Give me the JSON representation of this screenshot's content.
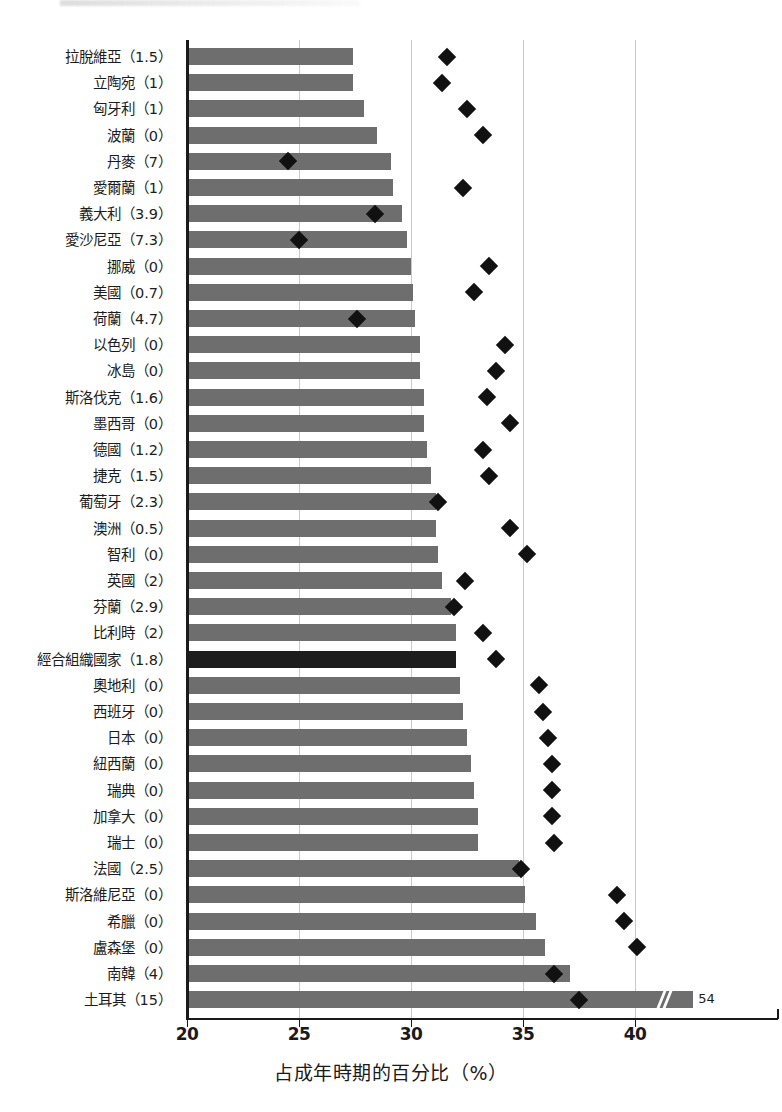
{
  "chart_data": {
    "type": "bar",
    "title": "",
    "xlabel": "占成年時期的百分比（%）",
    "ylabel": "",
    "xlim": [
      20,
      42.6
    ],
    "ticks": [
      20,
      25,
      30,
      35,
      40
    ],
    "tick_labels": [
      "20",
      "25",
      "30",
      "35",
      "40"
    ],
    "grid": "vertical",
    "legend": "none",
    "series": [
      {
        "name": "bar",
        "marker": "bar"
      },
      {
        "name": "diamond",
        "marker": "diamond"
      }
    ],
    "categories": [
      "拉脫維亞（1.5）",
      "立陶宛（1）",
      "匈牙利（1）",
      "波蘭（0）",
      "丹麥（7）",
      "愛爾蘭（1）",
      "義大利（3.9）",
      "愛沙尼亞（7.3）",
      "挪威（0）",
      "美國（0.7）",
      "荷蘭（4.7）",
      "以色列（0）",
      "冰島（0）",
      "斯洛伐克（1.6）",
      "墨西哥（0）",
      "德國（1.2）",
      "捷克（1.5）",
      "葡萄牙（2.3）",
      "澳洲（0.5）",
      "智利（0）",
      "英國（2）",
      "芬蘭（2.9）",
      "比利時（2）",
      "經合組織國家（1.8）",
      "奧地利（0）",
      "西班牙（0）",
      "日本（0）",
      "紐西蘭（0）",
      "瑞典（0）",
      "加拿大（0）",
      "瑞士（0）",
      "法國（2.5）",
      "斯洛維尼亞（0）",
      "希臘（0）",
      "盧森堡（0）",
      "南韓（4）",
      "土耳其（15）"
    ],
    "country_names": [
      "拉脫維亞",
      "立陶宛",
      "匈牙利",
      "波蘭",
      "丹麥",
      "愛爾蘭",
      "義大利",
      "愛沙尼亞",
      "挪威",
      "美國",
      "荷蘭",
      "以色列",
      "冰島",
      "斯洛伐克",
      "墨西哥",
      "德國",
      "捷克",
      "葡萄牙",
      "澳洲",
      "智利",
      "英國",
      "芬蘭",
      "比利時",
      "經合組織國家",
      "奧地利",
      "西班牙",
      "日本",
      "紐西蘭",
      "瑞典",
      "加拿大",
      "瑞士",
      "法國",
      "斯洛維尼亞",
      "希臘",
      "盧森堡",
      "南韓",
      "土耳其"
    ],
    "paren_values": [
      "1.5",
      "1",
      "1",
      "0",
      "7",
      "1",
      "3.9",
      "7.3",
      "0",
      "0.7",
      "4.7",
      "0",
      "0",
      "1.6",
      "0",
      "1.2",
      "1.5",
      "2.3",
      "0.5",
      "0",
      "2",
      "2.9",
      "2",
      "1.8",
      "0",
      "0",
      "0",
      "0",
      "0",
      "0",
      "0",
      "2.5",
      "0",
      "0",
      "0",
      "4",
      "15"
    ],
    "values": [
      27.4,
      27.4,
      27.9,
      28.5,
      29.1,
      29.2,
      29.6,
      29.8,
      30.0,
      30.1,
      30.2,
      30.4,
      30.4,
      30.6,
      30.6,
      30.7,
      30.9,
      31.1,
      31.1,
      31.2,
      31.4,
      31.8,
      32.0,
      32.0,
      32.2,
      32.3,
      32.5,
      32.7,
      32.8,
      33.0,
      33.0,
      34.8,
      35.1,
      35.6,
      36.0,
      37.1,
      42.6
    ],
    "diamond_values": [
      31.6,
      31.4,
      32.5,
      33.2,
      24.5,
      32.3,
      28.4,
      25.0,
      33.5,
      32.8,
      27.6,
      34.2,
      33.8,
      33.4,
      34.4,
      33.2,
      33.5,
      31.2,
      34.4,
      35.2,
      32.4,
      31.9,
      33.2,
      33.8,
      35.7,
      35.9,
      36.1,
      36.3,
      36.3,
      36.3,
      36.4,
      34.9,
      39.2,
      39.5,
      40.1,
      36.4,
      37.5
    ],
    "highlight_index": 23,
    "broken_bar": {
      "index": 36,
      "label": "54",
      "actual_value": 54
    }
  }
}
